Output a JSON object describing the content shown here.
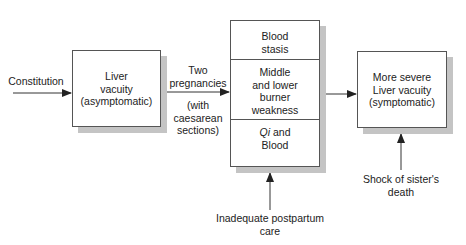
{
  "diagram": {
    "inputs": {
      "constitution": "Constitution",
      "postpartum": [
        "Inadequate postpartum",
        "care"
      ],
      "shock": [
        "Shock of sister's",
        "death"
      ]
    },
    "edge_label_top": [
      "Two",
      "pregnancies"
    ],
    "edge_label_bottom": [
      "(with",
      "caesarean",
      "sections)"
    ],
    "box_liver": [
      "Liver",
      "vacuity",
      "(asymptomatic)"
    ],
    "box_center": {
      "blood_stasis": [
        "Blood",
        "stasis"
      ],
      "burner_weakness": [
        "Middle",
        "and lower",
        "burner",
        "weakness"
      ],
      "qi_blood_italic": "Qi",
      "qi_blood_rest": " and",
      "qi_blood_line2": "Blood"
    },
    "box_severe": [
      "More severe",
      "Liver vacuity",
      "(symptomatic)"
    ]
  }
}
